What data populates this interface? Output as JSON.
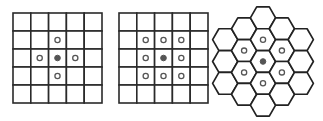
{
  "figures": [
    {
      "name": "von-neumann-neighborhood",
      "type": "square-grid",
      "rows": 5,
      "cols": 5,
      "center": [
        2,
        2
      ],
      "neighbors": [
        [
          1,
          2
        ],
        [
          2,
          1
        ],
        [
          2,
          3
        ],
        [
          3,
          2
        ]
      ]
    },
    {
      "name": "moore-neighborhood",
      "type": "square-grid",
      "rows": 5,
      "cols": 5,
      "center": [
        2,
        2
      ],
      "neighbors": [
        [
          1,
          1
        ],
        [
          1,
          2
        ],
        [
          1,
          3
        ],
        [
          2,
          1
        ],
        [
          2,
          3
        ],
        [
          3,
          1
        ],
        [
          3,
          2
        ],
        [
          3,
          3
        ]
      ]
    },
    {
      "name": "hexagonal-neighborhood",
      "type": "hex-grid",
      "column_counts": [
        3,
        4,
        5,
        4,
        3
      ],
      "center": [
        2,
        2
      ],
      "neighbors": [
        [
          2,
          1
        ],
        [
          2,
          3
        ],
        [
          1,
          1
        ],
        [
          1,
          2
        ],
        [
          3,
          1
        ],
        [
          3,
          2
        ]
      ]
    }
  ],
  "colors": {
    "grid_line": "#2a2a2a",
    "center_fill": "#555555",
    "neighbor_stroke": "#555555",
    "background": "#ffffff"
  }
}
